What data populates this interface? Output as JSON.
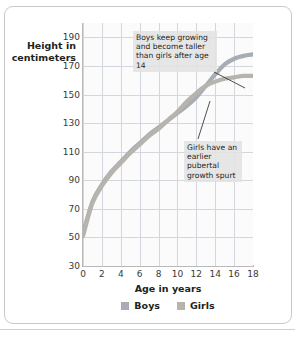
{
  "figure": {
    "y_axis_title_line1": "Height in",
    "y_axis_title_line2": "centimeters"
  },
  "annotations": {
    "boys_note": "Boys keep growing and become taller than girls after age 14",
    "girls_note": "Girls have an earlier pubertal growth spurt"
  },
  "legend": {
    "boys_label": "Boys",
    "girls_label": "Girls",
    "boys_color": "#a8adb5",
    "girls_color": "#b7b3ad"
  },
  "chart_data": {
    "type": "line",
    "title": "",
    "xlabel": "Age in years",
    "ylabel": "Height in centimeters",
    "xlim": [
      0,
      18
    ],
    "ylim": [
      30,
      200
    ],
    "xticks": [
      0,
      2,
      4,
      6,
      8,
      10,
      12,
      14,
      16,
      18
    ],
    "yticks": [
      30,
      50,
      70,
      90,
      110,
      130,
      150,
      170,
      190
    ],
    "grid": true,
    "legend_position": "bottom-center",
    "x": [
      0,
      1,
      2,
      3,
      4,
      5,
      6,
      7,
      8,
      9,
      10,
      11,
      12,
      13,
      14,
      15,
      16,
      17,
      18
    ],
    "series": [
      {
        "name": "Boys",
        "color": "#a8adb5",
        "values": [
          53,
          75,
          87,
          96,
          103,
          110,
          116,
          122,
          127,
          132,
          137,
          142,
          148,
          156,
          164,
          171,
          175,
          177,
          178
        ]
      },
      {
        "name": "Girls",
        "color": "#b7b3ad",
        "values": [
          51,
          74,
          86,
          95,
          102,
          109,
          115,
          121,
          126,
          132,
          138,
          145,
          151,
          156,
          159,
          161,
          162,
          163,
          163
        ]
      }
    ]
  }
}
